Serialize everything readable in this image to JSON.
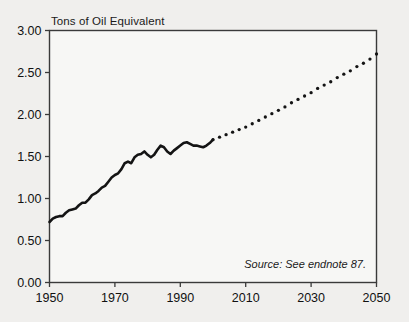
{
  "chart_data": {
    "type": "line",
    "title": "",
    "ylabel": "Tons of Oil Equivalent",
    "xlabel": "",
    "ylim": [
      0.0,
      3.0
    ],
    "xlim": [
      1950,
      2050
    ],
    "grid": false,
    "legend": null,
    "annotation": "Source: See endnote 87.",
    "ytick_labels": [
      "3.00",
      "2.50",
      "2.00",
      "1.50",
      "1.00",
      "0.50",
      "0.00"
    ],
    "ytick_values": [
      3.0,
      2.5,
      2.0,
      1.5,
      1.0,
      0.5,
      0.0
    ],
    "xtick_labels": [
      "1950",
      "1970",
      "1990",
      "2010",
      "2030",
      "2050"
    ],
    "xtick_values": [
      1950,
      1970,
      1990,
      2010,
      2030,
      2050
    ],
    "series": [
      {
        "name": "historical",
        "style": "solid",
        "x": [
          1950,
          1951,
          1952,
          1953,
          1954,
          1955,
          1956,
          1957,
          1958,
          1959,
          1960,
          1961,
          1962,
          1963,
          1964,
          1965,
          1966,
          1967,
          1968,
          1969,
          1970,
          1971,
          1972,
          1973,
          1974,
          1975,
          1976,
          1977,
          1978,
          1979,
          1980,
          1981,
          1982,
          1983,
          1984,
          1985,
          1986,
          1987,
          1988,
          1989,
          1990,
          1991,
          1992,
          1993,
          1994,
          1995,
          1996,
          1997,
          1998,
          1999,
          2000
        ],
        "values": [
          0.72,
          0.76,
          0.78,
          0.79,
          0.79,
          0.83,
          0.86,
          0.87,
          0.88,
          0.92,
          0.95,
          0.95,
          0.99,
          1.04,
          1.06,
          1.09,
          1.13,
          1.15,
          1.2,
          1.25,
          1.28,
          1.3,
          1.35,
          1.42,
          1.44,
          1.42,
          1.49,
          1.52,
          1.53,
          1.56,
          1.52,
          1.49,
          1.52,
          1.58,
          1.63,
          1.61,
          1.56,
          1.53,
          1.57,
          1.6,
          1.63,
          1.66,
          1.67,
          1.65,
          1.63,
          1.63,
          1.62,
          1.61,
          1.63,
          1.66,
          1.7
        ]
      },
      {
        "name": "projection",
        "style": "dotted",
        "x": [
          2000,
          2002,
          2004,
          2006,
          2008,
          2010,
          2012,
          2014,
          2016,
          2018,
          2020,
          2022,
          2024,
          2026,
          2028,
          2030,
          2032,
          2034,
          2036,
          2038,
          2040,
          2042,
          2044,
          2046,
          2048,
          2050
        ],
        "values": [
          1.7,
          1.73,
          1.76,
          1.79,
          1.82,
          1.85,
          1.89,
          1.93,
          1.97,
          2.01,
          2.05,
          2.09,
          2.14,
          2.18,
          2.22,
          2.26,
          2.31,
          2.35,
          2.39,
          2.44,
          2.48,
          2.52,
          2.57,
          2.61,
          2.66,
          2.72
        ]
      }
    ]
  }
}
